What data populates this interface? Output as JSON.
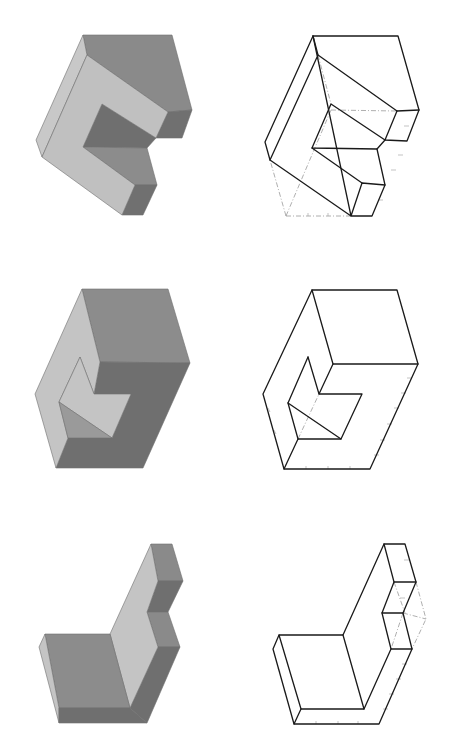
{
  "figure": {
    "layout": "3 rows x 2 columns: shaded isometric solid (left) and line-drawing isometric view (right)",
    "colors": {
      "light_face": "#c4c4c4",
      "mid_face": "#8c8c8c",
      "dark_face": "#6f6f6f",
      "edge": "#1a1a1a",
      "hidden_edge": "#9a9a9a",
      "background": "#ffffff"
    },
    "rows": [
      {
        "id": "row-1",
        "shape": "C-shaped block (open notch on right)",
        "shaded": true,
        "line_drawing": true,
        "hidden_lines": "dash-dot construction box"
      },
      {
        "id": "row-2",
        "shape": "Box with triangular/arrow-shaped recess on front",
        "shaded": true,
        "line_drawing": true,
        "hidden_lines": "single dashed edge in recess"
      },
      {
        "id": "row-3",
        "shape": "L-shaped bracket with stepped upright",
        "shaded": true,
        "line_drawing": true,
        "hidden_lines": "dashed construction lines at step"
      }
    ]
  }
}
